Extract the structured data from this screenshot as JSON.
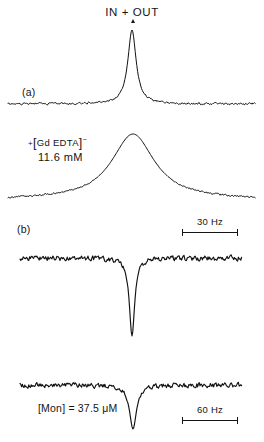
{
  "figure": {
    "title": "IN + OUT",
    "panel_a_label": "(a)",
    "panel_b_label": "(b)",
    "gd_label_prefix": "+",
    "gd_label_open": "[",
    "gd_label_text": "Gd EDTA",
    "gd_label_close": "]",
    "gd_label_charge": "−",
    "gd_concentration": "11.6 mM",
    "mon_label": "[Mon] = 37.5 μM",
    "scalebar_30": "30 Hz",
    "scalebar_60": "60 Hz",
    "line_color": "#121212",
    "background_color": "#ffffff"
  },
  "chart_data": {
    "type": "line",
    "title": "IN + OUT",
    "xlabel": "",
    "ylabel": "",
    "grid": false,
    "legend": null,
    "annotations": [
      {
        "text": "IN + OUT",
        "x": 132,
        "y": 12,
        "role": "peak-assignment"
      },
      {
        "text": "(a)",
        "x": 26,
        "y": 92,
        "role": "panel-label"
      },
      {
        "text": "+[Gd EDTA]−",
        "x": 55,
        "y": 141,
        "role": "sample-condition"
      },
      {
        "text": "11.6 mM",
        "x": 58,
        "y": 157,
        "role": "concentration"
      },
      {
        "text": "(b)",
        "x": 22,
        "y": 229,
        "role": "panel-label"
      },
      {
        "text": "[Mon] = 37.5 μM",
        "x": 82,
        "y": 408,
        "role": "concentration"
      },
      {
        "text": "30 Hz",
        "x": 210,
        "y": 220,
        "role": "scale-bar"
      },
      {
        "text": "60 Hz",
        "x": 210,
        "y": 408,
        "role": "scale-bar"
      }
    ],
    "scale_bars": [
      {
        "label": "30 Hz",
        "x_start": 182,
        "x_end": 238,
        "y": 226,
        "value": 30,
        "unit": "Hz"
      },
      {
        "label": "60 Hz",
        "x_start": 182,
        "x_end": 238,
        "y": 414,
        "value": 60,
        "unit": "Hz"
      }
    ],
    "traces": [
      {
        "name": "trace-a-sharp",
        "panel": "a",
        "baseline_y": 104,
        "peak_center_x": 132,
        "peak_amplitude": 74,
        "peak_halfwidth": 5,
        "polarity": "up",
        "noise": 1.6,
        "x_range": [
          8,
          256
        ]
      },
      {
        "name": "trace-a-broad",
        "panel": "a",
        "baseline_y": 200,
        "peak_center_x": 133,
        "peak_amplitude": 66,
        "peak_halfwidth": 26,
        "polarity": "up",
        "noise": 1.4,
        "x_range": [
          8,
          256
        ]
      },
      {
        "name": "trace-b-sharp",
        "panel": "b",
        "baseline_y": 258,
        "peak_center_x": 132,
        "peak_amplitude": 78,
        "peak_halfwidth": 3.2,
        "polarity": "down",
        "noise": 3.6,
        "x_range": [
          20,
          242
        ]
      },
      {
        "name": "trace-b-broad",
        "panel": "b",
        "baseline_y": 385,
        "peak_center_x": 133,
        "peak_amplitude": 44,
        "peak_halfwidth": 4.2,
        "polarity": "down",
        "noise": 3.4,
        "x_range": [
          20,
          242
        ]
      }
    ]
  }
}
